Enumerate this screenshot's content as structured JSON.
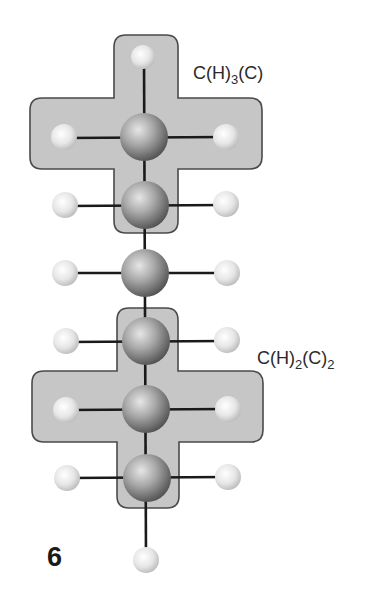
{
  "figure": {
    "number": "6"
  },
  "groups": [
    {
      "id": "methyl-group",
      "label": {
        "base1": "C(H)",
        "sub1": "3",
        "base2": "(C)",
        "sub2": ""
      }
    },
    {
      "id": "methylene-group",
      "label": {
        "base1": "C(H)",
        "sub1": "2",
        "base2": "(C)",
        "sub2": "2"
      }
    }
  ],
  "atoms": {
    "carbon_count": 6,
    "hydrogen_count": 14
  },
  "colors": {
    "group_fill": "#c6c6c6",
    "group_border": "#4a4a4a",
    "bond": "#1a1a1a",
    "carbon_highlight": "#e2e2e2",
    "carbon_shadow": "#555555",
    "hydrogen_highlight": "#ffffff",
    "hydrogen_shadow": "#bdbdbd"
  }
}
